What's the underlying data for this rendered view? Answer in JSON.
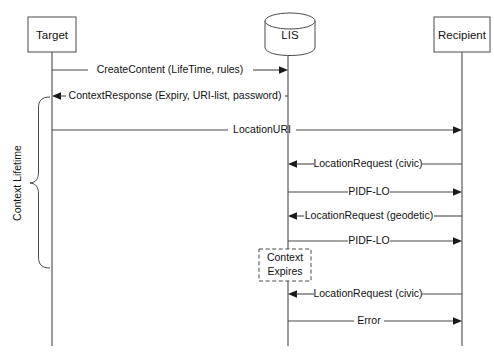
{
  "diagram": {
    "type": "uml-sequence-diagram",
    "title": "",
    "background_color": "#ffffff",
    "line_color": "#4a4a4a",
    "text_color": "#111111",
    "participants": [
      {
        "id": "target",
        "label": "Target",
        "shape": "rectangle",
        "lifeline_x": 52,
        "box": {
          "x": 28,
          "y": 17,
          "w": 48,
          "h": 35
        }
      },
      {
        "id": "lis",
        "label": "LIS",
        "shape": "cylinder",
        "lifeline_x": 288,
        "box": {
          "x": 265,
          "y": 13,
          "w": 50,
          "h": 42
        }
      },
      {
        "id": "recipient",
        "label": "Recipient",
        "shape": "rectangle",
        "lifeline_x": 462,
        "box": {
          "x": 434,
          "y": 17,
          "w": 56,
          "h": 35
        }
      }
    ],
    "lifeline_bottom_y": 346,
    "messages": [
      {
        "label": "CreateContent (LifeTime, rules)",
        "from": "target",
        "to": "lis",
        "direction": "right",
        "y": 70
      },
      {
        "label": "ContextResponse (Expiry, URI-list, password)",
        "from": "lis",
        "to": "target",
        "direction": "left",
        "y": 96
      },
      {
        "label": "LocationURI",
        "from": "target",
        "to": "recipient",
        "direction": "right",
        "y": 130
      },
      {
        "label": "LocationRequest (civic)",
        "from": "recipient",
        "to": "lis",
        "direction": "left",
        "y": 164
      },
      {
        "label": "PIDF-LO",
        "from": "lis",
        "to": "recipient",
        "direction": "right",
        "y": 192
      },
      {
        "label": "LocationRequest (geodetic)",
        "from": "recipient",
        "to": "lis",
        "direction": "left",
        "y": 216
      },
      {
        "label": "PIDF-LO",
        "from": "lis",
        "to": "recipient",
        "direction": "right",
        "y": 241
      },
      {
        "label": "LocationRequest (civic)",
        "from": "recipient",
        "to": "lis",
        "direction": "left",
        "y": 294
      },
      {
        "label": "Error",
        "from": "lis",
        "to": "recipient",
        "direction": "right",
        "y": 321
      }
    ],
    "notes": [
      {
        "id": "context-expires",
        "line1": "Context",
        "line2": "Expires",
        "style": "dashed",
        "box": {
          "x": 259,
          "y": 249,
          "w": 52,
          "h": 32
        }
      }
    ],
    "braces": [
      {
        "id": "context-lifetime",
        "label": "Context Lifetime",
        "orientation": "vertical-left",
        "top_y": 97,
        "bottom_y": 268,
        "right_x": 46,
        "tip_x": 30,
        "label_x": 18,
        "label_y": 183
      }
    ]
  }
}
